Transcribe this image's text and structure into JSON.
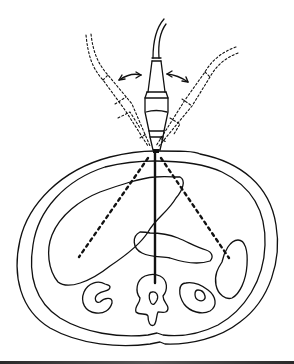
{
  "figure": {
    "type": "medical-illustration",
    "colors": {
      "line": "#111111",
      "background": "#ffffff",
      "bottom_bar": "#333333"
    },
    "elements": {
      "probe": "transducer-with-cable",
      "probe_ghosts": [
        "tilted-left-dotted",
        "tilted-right-dotted"
      ],
      "motion_arrows": [
        "left-double-arrow",
        "right-double-arrow"
      ],
      "beam_lines": [
        "center-solid",
        "left-dotted",
        "right-dotted"
      ],
      "anatomy": [
        "skin-outline",
        "muscle-outline",
        "liver",
        "pancreas",
        "spleen",
        "right-kidney",
        "left-kidney",
        "vertebra"
      ]
    }
  }
}
